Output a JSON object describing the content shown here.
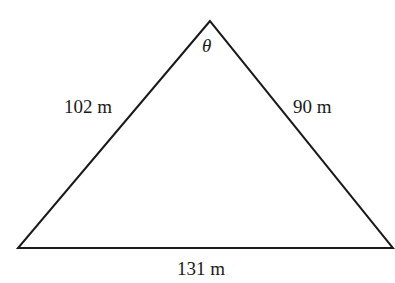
{
  "diagram": {
    "type": "triangle",
    "vertices": {
      "apex": [
        210,
        21
      ],
      "left": [
        18,
        248
      ],
      "right": [
        393,
        248
      ]
    },
    "angle_label": "θ",
    "sides": {
      "left": "102 m",
      "right": "90 m",
      "base": "131 m"
    },
    "stroke_color": "#1a1a1a",
    "background": "#ffffff"
  }
}
